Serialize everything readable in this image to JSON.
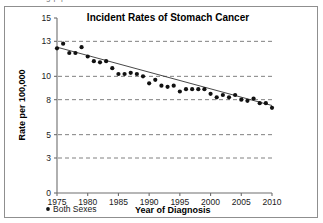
{
  "clipped_header": {
    "text": "g p p"
  },
  "figure": {
    "legend": {
      "marker_name": "dot-marker",
      "label": "Both Sexes"
    }
  },
  "chart_data": {
    "type": "scatter",
    "title": "Incident Rates of Stomach Cancer",
    "xlabel": "Year of Diagnosis",
    "ylabel": "Rate per 100,000",
    "xlim": [
      1975,
      2010
    ],
    "ylim": [
      0,
      15
    ],
    "xticks": [
      1975,
      1980,
      1985,
      1990,
      1995,
      2000,
      2005,
      2010
    ],
    "yticks": [
      0,
      3,
      5,
      8,
      10,
      13,
      15
    ],
    "grid": "horizontal-dashed",
    "legend_position": "bottom-left",
    "series": [
      {
        "name": "Both Sexes",
        "marker": "filled-circle",
        "color": "#111111",
        "x": [
          1975,
          1976,
          1977,
          1978,
          1979,
          1980,
          1981,
          1982,
          1983,
          1984,
          1985,
          1986,
          1987,
          1988,
          1989,
          1990,
          1991,
          1992,
          1993,
          1994,
          1995,
          1996,
          1997,
          1998,
          1999,
          2000,
          2001,
          2002,
          2003,
          2004,
          2005,
          2006,
          2007,
          2008,
          2009,
          2010
        ],
        "values": [
          12.4,
          12.8,
          12.0,
          12.0,
          12.5,
          11.7,
          11.3,
          11.2,
          11.3,
          10.7,
          10.2,
          10.2,
          10.3,
          10.2,
          10.0,
          9.4,
          9.7,
          9.2,
          9.1,
          9.2,
          8.7,
          8.9,
          8.9,
          8.9,
          8.9,
          8.5,
          8.2,
          8.4,
          8.2,
          8.4,
          8.0,
          7.9,
          8.1,
          7.7,
          7.7,
          7.3
        ]
      }
    ],
    "trendline": {
      "name": "fitted-trend",
      "x": [
        1975,
        2010
      ],
      "values": [
        12.5,
        7.5
      ]
    }
  }
}
